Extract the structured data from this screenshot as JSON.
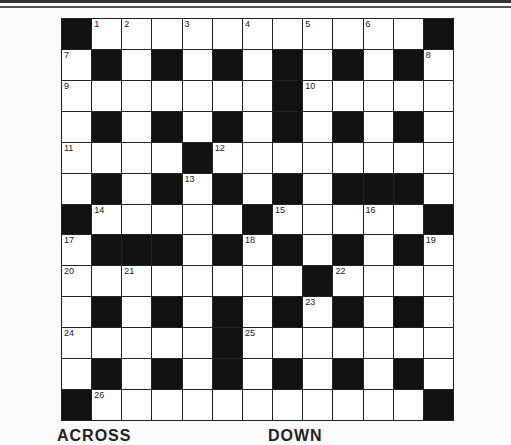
{
  "puzzle": {
    "rows": 13,
    "cols": 13,
    "layout": [
      "BWWWWWWWWWWWB",
      "WBWBWBWBWBWBW",
      "WWWWWWWBWWWWW",
      "WBWBWBWBWBWBW",
      "WWWWBWWWWWWWW",
      "WBWBWBWBWBBBW",
      "BWWWWWBWWWWWB",
      "WBBBWBWBWBWBW",
      "WWWWWWWWBWWWW",
      "WBWBWBWBWBWBW",
      "WWWWWBWWWWWWW",
      "WBWBWBWBWBWBW",
      "BWWWWWWWWWWWB"
    ],
    "numbers": [
      {
        "r": 0,
        "c": 1,
        "n": "1"
      },
      {
        "r": 0,
        "c": 2,
        "n": "2"
      },
      {
        "r": 0,
        "c": 4,
        "n": "3"
      },
      {
        "r": 0,
        "c": 6,
        "n": "4"
      },
      {
        "r": 0,
        "c": 8,
        "n": "5"
      },
      {
        "r": 0,
        "c": 10,
        "n": "6"
      },
      {
        "r": 1,
        "c": 0,
        "n": "7"
      },
      {
        "r": 1,
        "c": 12,
        "n": "8"
      },
      {
        "r": 2,
        "c": 0,
        "n": "9"
      },
      {
        "r": 2,
        "c": 8,
        "n": "10"
      },
      {
        "r": 4,
        "c": 0,
        "n": "11"
      },
      {
        "r": 4,
        "c": 5,
        "n": "12"
      },
      {
        "r": 5,
        "c": 4,
        "n": "13"
      },
      {
        "r": 6,
        "c": 1,
        "n": "14"
      },
      {
        "r": 6,
        "c": 7,
        "n": "15"
      },
      {
        "r": 6,
        "c": 10,
        "n": "16"
      },
      {
        "r": 7,
        "c": 0,
        "n": "17"
      },
      {
        "r": 7,
        "c": 6,
        "n": "18"
      },
      {
        "r": 7,
        "c": 12,
        "n": "19"
      },
      {
        "r": 8,
        "c": 0,
        "n": "20"
      },
      {
        "r": 8,
        "c": 2,
        "n": "21"
      },
      {
        "r": 8,
        "c": 9,
        "n": "22"
      },
      {
        "r": 9,
        "c": 8,
        "n": "23"
      },
      {
        "r": 10,
        "c": 0,
        "n": "24"
      },
      {
        "r": 10,
        "c": 6,
        "n": "25"
      },
      {
        "r": 12,
        "c": 1,
        "n": "26"
      }
    ]
  },
  "headings": {
    "across": "ACROSS",
    "down": "DOWN"
  },
  "colors": {
    "black_cell": "#111111",
    "white_cell": "#ffffff"
  }
}
